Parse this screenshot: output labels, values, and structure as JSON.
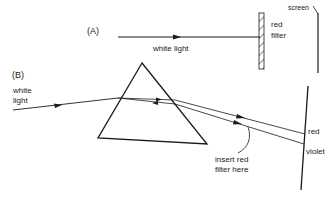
{
  "part_a": {
    "label": "(A)",
    "beam_label": "white light",
    "filter_label_1": "red",
    "filter_label_2": "filter",
    "screen_label": "screen"
  },
  "part_b": {
    "label": "(B)",
    "beam_label_1": "white",
    "beam_label_2": "light",
    "red_label": "red",
    "violet_label": "violet",
    "annotation_1": "insert red",
    "annotation_2": "filter here"
  },
  "colors": {
    "line": "#1a1a1a",
    "background": "#ffffff"
  }
}
